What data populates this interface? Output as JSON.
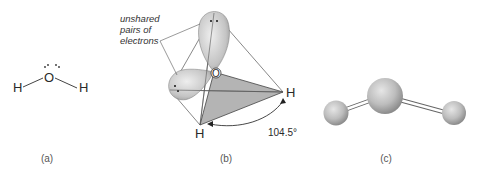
{
  "panels": {
    "a": {
      "caption": "(a)",
      "atoms": {
        "oxygen": "O",
        "hydrogen_left": "H",
        "hydrogen_right": "H"
      }
    },
    "b": {
      "caption": "(b)",
      "annotation": {
        "line1": "unshared",
        "line2": "pairs of",
        "line3": "electrons"
      },
      "atoms": {
        "oxygen": "O",
        "hydrogen_right": "H",
        "hydrogen_bottom": "H"
      },
      "bond_angle": "104.5°"
    },
    "c": {
      "caption": "(c)"
    }
  },
  "colors": {
    "sphere": "#b8b8b8",
    "sphere_dark": "#8a8a8a",
    "plane": "#b0b0b0",
    "lines": "#555555"
  }
}
